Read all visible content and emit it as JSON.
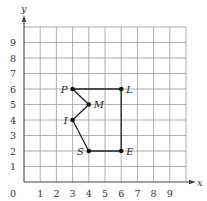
{
  "diagram": {
    "type": "coordinate-grid",
    "axes": {
      "x_label": "x",
      "y_label": "y",
      "origin_label": "0",
      "x_ticks": [
        "1",
        "2",
        "3",
        "4",
        "5",
        "6",
        "7",
        "8",
        "9"
      ],
      "y_ticks": [
        "1",
        "2",
        "3",
        "4",
        "5",
        "6",
        "7",
        "8",
        "9"
      ],
      "x_range": [
        0,
        10
      ],
      "y_range": [
        0,
        10
      ]
    },
    "grid": {
      "visible": true,
      "color": "#9a9a9a",
      "axis_color": "#444444"
    },
    "points": [
      {
        "label": "P",
        "x": 3,
        "y": 6,
        "label_side": "left"
      },
      {
        "label": "L",
        "x": 6,
        "y": 6,
        "label_side": "right"
      },
      {
        "label": "M",
        "x": 4,
        "y": 5,
        "label_side": "right"
      },
      {
        "label": "I",
        "x": 3,
        "y": 4,
        "label_side": "left"
      },
      {
        "label": "S",
        "x": 4,
        "y": 2,
        "label_side": "left"
      },
      {
        "label": "E",
        "x": 6,
        "y": 2,
        "label_side": "right"
      }
    ],
    "polygon_order": [
      "P",
      "L",
      "E",
      "S",
      "I",
      "M",
      "P"
    ],
    "line_color": "#222222",
    "point_color": "#111111"
  }
}
